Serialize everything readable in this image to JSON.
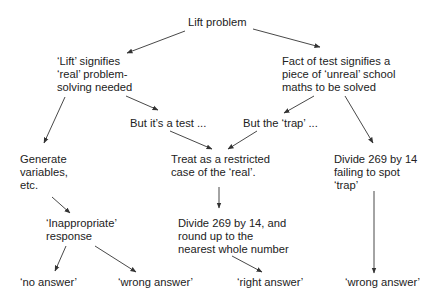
{
  "diagram": {
    "type": "flowchart-tree",
    "colors": {
      "text": "#222222",
      "edge": "#333333",
      "background": "#ffffff"
    },
    "nodes": {
      "root": {
        "lines": [
          "Lift problem"
        ]
      },
      "lift_real": {
        "lines": [
          "‘Lift’ signifies",
          "‘real’ problem-",
          "solving needed"
        ]
      },
      "test_unreal": {
        "lines": [
          "Fact of test signifies a",
          "piece of ‘unreal’ school",
          "maths to be solved"
        ]
      },
      "but_test": {
        "lines": [
          "But it’s a test ..."
        ]
      },
      "but_trap": {
        "lines": [
          "But the ‘trap’ ..."
        ]
      },
      "generate": {
        "lines": [
          "Generate",
          "variables,",
          "etc."
        ]
      },
      "treat": {
        "lines": [
          "Treat as a restricted",
          "case of the ‘real’."
        ]
      },
      "divide_fail": {
        "lines": [
          "Divide 269 by 14",
          "failing to spot",
          "‘trap’"
        ]
      },
      "inappropriate": {
        "lines": [
          "‘Inappropriate’",
          "response"
        ]
      },
      "divide_round": {
        "lines": [
          "Divide 269 by 14, and",
          "round up to the",
          "nearest whole number"
        ]
      },
      "no_answer": {
        "lines": [
          "‘no answer’"
        ]
      },
      "wrong_answer_1": {
        "lines": [
          "‘wrong answer’"
        ]
      },
      "right_answer": {
        "lines": [
          "‘right answer’"
        ]
      },
      "wrong_answer_2": {
        "lines": [
          "‘wrong answer’"
        ]
      }
    },
    "edges": [
      {
        "from": "root",
        "to": "lift_real"
      },
      {
        "from": "root",
        "to": "test_unreal"
      },
      {
        "from": "lift_real",
        "to": "generate"
      },
      {
        "from": "lift_real",
        "to": "but_test"
      },
      {
        "from": "test_unreal",
        "to": "but_trap"
      },
      {
        "from": "test_unreal",
        "to": "divide_fail"
      },
      {
        "from": "but_test",
        "to": "treat"
      },
      {
        "from": "but_trap",
        "to": "treat"
      },
      {
        "from": "generate",
        "to": "inappropriate"
      },
      {
        "from": "treat",
        "to": "divide_round"
      },
      {
        "from": "divide_fail",
        "to": "wrong_answer_2"
      },
      {
        "from": "inappropriate",
        "to": "no_answer"
      },
      {
        "from": "inappropriate",
        "to": "wrong_answer_1"
      },
      {
        "from": "divide_round",
        "to": "right_answer"
      }
    ]
  }
}
